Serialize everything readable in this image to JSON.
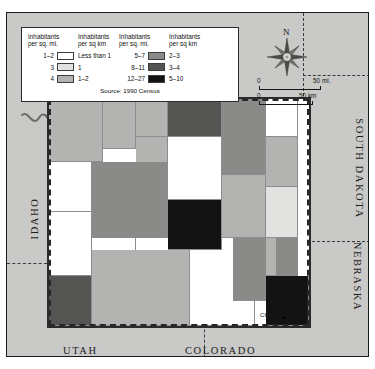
{
  "figure": {
    "source": "Source: 1990 Census"
  },
  "legend": {
    "columns": [
      {
        "head_sq_mi": "Inhabitants\nper sq. mi.",
        "head_sq_km": "Inhabitants\nper sq km",
        "rows": [
          {
            "range_mi": "1–2",
            "range_km": "Less than 1",
            "color": "#ffffff"
          },
          {
            "range_mi": "3",
            "range_km": "1",
            "color": "#e2e2e0"
          },
          {
            "range_mi": "4",
            "range_km": "1–2",
            "color": "#b3b3b1"
          }
        ]
      },
      {
        "head_sq_mi": "Inhabitants\nper sq. mi.",
        "head_sq_km": "Inhabitants\nper sq km",
        "rows": [
          {
            "range_mi": "5–7",
            "range_km": "2–3",
            "color": "#8a8a88"
          },
          {
            "range_mi": "8–11",
            "range_km": "3–4",
            "color": "#545452"
          },
          {
            "range_mi": "12–27",
            "range_km": "5–10",
            "color": "#131313"
          }
        ]
      }
    ],
    "head_mi_line1": "Inhabitants",
    "head_mi_line2": "per sq. mi.",
    "head_km_line1": "Inhabitants",
    "head_km_line2": "per sq km"
  },
  "compass": {
    "north_label": "N",
    "icon": "compass-rose-icon"
  },
  "scale": {
    "miles": {
      "zero": "0",
      "unit": "50 mi."
    },
    "kilometers": {
      "zero": "0",
      "unit": "50 km"
    }
  },
  "states": {
    "idaho": "IDAHO",
    "south_dakota": "SOUTH DAKOTA",
    "nebraska": "NEBRASKA",
    "utah": "UTAH",
    "colorado": "COLORADO"
  },
  "cities": [
    {
      "name": "Cheyenne",
      "label": "Cheyenne"
    }
  ],
  "map_data": {
    "type": "choropleth",
    "region": "Wyoming",
    "unit": "county",
    "variable": "population density",
    "classes": [
      {
        "id": "d1",
        "per_sq_mi": "1–2",
        "per_sq_km": "Less than 1",
        "color": "#ffffff"
      },
      {
        "id": "d2",
        "per_sq_mi": "3",
        "per_sq_km": "1",
        "color": "#e2e2e0"
      },
      {
        "id": "d3",
        "per_sq_mi": "4",
        "per_sq_km": "1–2",
        "color": "#b3b3b1"
      },
      {
        "id": "d4",
        "per_sq_mi": "5–7",
        "per_sq_km": "2–3",
        "color": "#8a8a88"
      },
      {
        "id": "d5",
        "per_sq_mi": "8–11",
        "per_sq_km": "3–4",
        "color": "#545452"
      },
      {
        "id": "d6",
        "per_sq_mi": "12–27",
        "per_sq_km": "5–10",
        "color": "#131313"
      }
    ],
    "counties": [
      {
        "name": "Park",
        "class": "d3",
        "col": 1,
        "row": 1,
        "cspan": 5,
        "rspan": 5
      },
      {
        "name": "Big Horn",
        "class": "d3",
        "col": 6,
        "row": 1,
        "cspan": 3,
        "rspan": 4
      },
      {
        "name": "Washakie",
        "class": "d3",
        "col": 9,
        "row": 1,
        "cspan": 3,
        "rspan": 3
      },
      {
        "name": "Sheridan",
        "class": "d5",
        "col": 12,
        "row": 1,
        "cspan": 5,
        "rspan": 3
      },
      {
        "name": "Campbell",
        "class": "d4",
        "col": 17,
        "row": 1,
        "cspan": 4,
        "rspan": 6
      },
      {
        "name": "Crook",
        "class": "d1",
        "col": 21,
        "row": 1,
        "cspan": 3,
        "rspan": 3
      },
      {
        "name": "Johnson",
        "class": "d1",
        "col": 12,
        "row": 4,
        "cspan": 5,
        "rspan": 5
      },
      {
        "name": "Weston",
        "class": "d3",
        "col": 21,
        "row": 4,
        "cspan": 3,
        "rspan": 4
      },
      {
        "name": "Hot Springs",
        "class": "d3",
        "col": 9,
        "row": 4,
        "cspan": 3,
        "rspan": 3
      },
      {
        "name": "Teton",
        "class": "d1",
        "col": 1,
        "row": 6,
        "cspan": 4,
        "rspan": 4
      },
      {
        "name": "Fremont",
        "class": "d4",
        "col": 5,
        "row": 6,
        "cspan": 7,
        "rspan": 6
      },
      {
        "name": "Natrona",
        "class": "d6",
        "col": 12,
        "row": 9,
        "cspan": 5,
        "rspan": 4
      },
      {
        "name": "Niobrara",
        "class": "d2",
        "col": 21,
        "row": 8,
        "cspan": 3,
        "rspan": 4
      },
      {
        "name": "Converse",
        "class": "d3",
        "col": 17,
        "row": 7,
        "cspan": 4,
        "rspan": 5
      },
      {
        "name": "Lincoln",
        "class": "d1",
        "col": 1,
        "row": 10,
        "cspan": 4,
        "rspan": 5
      },
      {
        "name": "Sublette",
        "class": "d1",
        "col": 5,
        "row": 12,
        "cspan": 4,
        "rspan": 3
      },
      {
        "name": "Sweetwater",
        "class": "d3",
        "col": 5,
        "row": 13,
        "cspan": 9,
        "rspan": 6
      },
      {
        "name": "Carbon",
        "class": "d1",
        "col": 14,
        "row": 13,
        "cspan": 6,
        "rspan": 6
      },
      {
        "name": "Albany",
        "class": "d4",
        "col": 18,
        "row": 12,
        "cspan": 4,
        "rspan": 5
      },
      {
        "name": "Platte",
        "class": "d3",
        "col": 21,
        "row": 12,
        "cspan": 3,
        "rspan": 3
      },
      {
        "name": "Goshen",
        "class": "d4",
        "col": 22,
        "row": 12,
        "cspan": 2,
        "rspan": 4
      },
      {
        "name": "Laramie",
        "class": "d6",
        "col": 21,
        "row": 15,
        "cspan": 4,
        "rspan": 4
      },
      {
        "name": "Uinta",
        "class": "d5",
        "col": 1,
        "row": 15,
        "cspan": 4,
        "rspan": 4
      }
    ]
  }
}
